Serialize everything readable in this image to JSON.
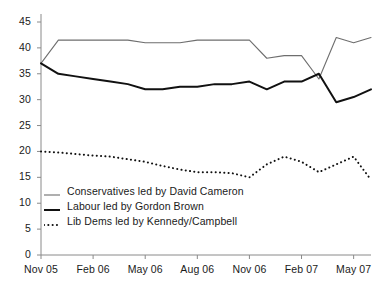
{
  "chart_data": {
    "type": "line",
    "title": "",
    "xlabel": "",
    "ylabel": "",
    "ylim": [
      0,
      45
    ],
    "ytick_labels": [
      "0",
      "5",
      "10",
      "15",
      "20",
      "25",
      "30",
      "35",
      "40",
      "45"
    ],
    "ytick_values": [
      0,
      5,
      10,
      15,
      20,
      25,
      30,
      35,
      40,
      45
    ],
    "xtick_labels": [
      "Nov 05",
      "Feb 06",
      "May 06",
      "Aug 06",
      "Nov 06",
      "Feb 07",
      "May 07"
    ],
    "xtick_values": [
      0,
      3,
      6,
      9,
      12,
      15,
      18
    ],
    "xlim": [
      0,
      19
    ],
    "grid": false,
    "legend_position": "lower-left-inside",
    "x_months": [
      0,
      1,
      2,
      3,
      4,
      5,
      6,
      7,
      8,
      9,
      10,
      11,
      12,
      13,
      14,
      15,
      16,
      17,
      18,
      19
    ],
    "series": [
      {
        "name": "Conservatives led by David Cameron",
        "style": "thin-solid",
        "color": "#6e6e6e",
        "values": [
          37.0,
          41.5,
          41.5,
          41.5,
          41.5,
          41.5,
          41.0,
          41.0,
          41.0,
          41.5,
          41.5,
          41.5,
          41.5,
          38.0,
          38.5,
          38.5,
          34.0,
          42.0,
          41.0,
          42.0
        ]
      },
      {
        "name": "Labour led by Gordon Brown",
        "style": "thick-solid",
        "color": "#111111",
        "values": [
          37.0,
          35.0,
          34.5,
          34.0,
          33.5,
          33.0,
          32.0,
          32.0,
          32.5,
          32.5,
          33.0,
          33.0,
          33.5,
          32.0,
          33.5,
          33.5,
          35.0,
          29.5,
          30.5,
          32.0
        ]
      },
      {
        "name": "Lib Dems led by Kennedy/Campbell",
        "style": "dotted",
        "color": "#111111",
        "values": [
          20.0,
          19.8,
          19.5,
          19.2,
          19.0,
          18.5,
          18.0,
          17.2,
          16.5,
          16.0,
          16.0,
          15.8,
          15.0,
          17.5,
          19.0,
          18.0,
          16.0,
          17.5,
          19.0,
          14.5
        ]
      }
    ]
  },
  "legend": {
    "items": [
      {
        "label": "Conservatives led by David Cameron",
        "style": "thin-solid"
      },
      {
        "label": "Labour led by Gordon Brown",
        "style": "thick-solid"
      },
      {
        "label": "Lib Dems led by Kennedy/Campbell",
        "style": "dotted"
      }
    ]
  },
  "axes": {
    "axis_color": "#8a8a8a",
    "text_color": "#1a1a1a"
  }
}
